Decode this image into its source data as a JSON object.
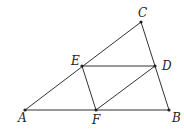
{
  "diagram": {
    "points": {
      "A": {
        "label": "A",
        "x": 25,
        "y": 110,
        "lx": 18,
        "ly": 122
      },
      "B": {
        "label": "B",
        "x": 169,
        "y": 110,
        "lx": 172,
        "ly": 122
      },
      "C": {
        "label": "C",
        "x": 141,
        "y": 22,
        "lx": 138,
        "ly": 17
      },
      "D": {
        "label": "D",
        "x": 155,
        "y": 66,
        "lx": 162,
        "ly": 70
      },
      "E": {
        "label": "E",
        "x": 82,
        "y": 66,
        "lx": 71,
        "ly": 65
      },
      "F": {
        "label": "F",
        "x": 96,
        "y": 110,
        "lx": 92,
        "ly": 124
      }
    },
    "segments": [
      "AB",
      "BC",
      "CA",
      "ED",
      "EF",
      "FD"
    ],
    "stroke_color": "#333333"
  }
}
